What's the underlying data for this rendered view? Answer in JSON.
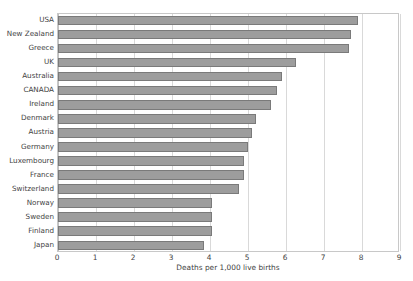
{
  "chart_data": {
    "type": "bar",
    "orientation": "horizontal",
    "title": "",
    "xlabel": "Deaths per 1,000 live births",
    "ylabel": "",
    "xlim": [
      0,
      9
    ],
    "xticks": [
      0,
      1,
      2,
      3,
      4,
      5,
      6,
      7,
      8,
      9
    ],
    "grid": "vertical",
    "legend": "none",
    "bar_color": "#9d9d9d",
    "bar_border_color": "#7a7a7a",
    "categories": [
      "USA",
      "New Zealand",
      "Greece",
      "UK",
      "Australia",
      "CANADA",
      "Ireland",
      "Denmark",
      "Austria",
      "Germany",
      "Luxembourg",
      "France",
      "Switzerland",
      "Norway",
      "Sweden",
      "Finland",
      "Japan"
    ],
    "values": [
      7.9,
      7.7,
      7.65,
      6.25,
      5.9,
      5.75,
      5.6,
      5.2,
      5.1,
      5.0,
      4.9,
      4.9,
      4.75,
      4.05,
      4.05,
      4.05,
      3.85
    ]
  }
}
